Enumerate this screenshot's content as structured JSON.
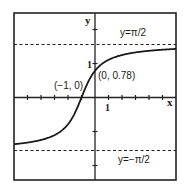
{
  "chart_data": {
    "type": "line",
    "title": "",
    "function": "y = arctan(x + 1)",
    "xlabel": "x",
    "ylabel": "y",
    "xlim": [
      -6,
      6
    ],
    "ylim": [
      -2.4,
      2.5
    ],
    "grid": false,
    "legend": null,
    "x_ticks": [
      -5,
      -4,
      -3,
      -2,
      -1,
      1,
      2,
      3,
      4,
      5
    ],
    "x_tick_labels": [
      {
        "value": 1,
        "label": "1"
      }
    ],
    "y_ticks": [
      -2,
      -1,
      1,
      2
    ],
    "y_tick_labels": [
      {
        "value": 1,
        "label": "1"
      }
    ],
    "series": [
      {
        "name": "arctan(x+1)",
        "x": [
          -6,
          -5,
          -4,
          -3,
          -2,
          -1.5,
          -1,
          -0.5,
          0,
          0.5,
          1,
          2,
          3,
          4,
          5,
          6
        ],
        "values": [
          -1.373,
          -1.326,
          -1.249,
          -1.107,
          -0.785,
          -0.464,
          0,
          0.464,
          0.785,
          0.983,
          1.107,
          1.249,
          1.326,
          1.373,
          1.406,
          1.429
        ]
      }
    ],
    "asymptotes": [
      {
        "y": 1.5708,
        "label": "y=π/2",
        "style": "dashed"
      },
      {
        "y": -1.5708,
        "label": "y=−π/2",
        "style": "dashed"
      }
    ],
    "annotations": [
      {
        "x": -1,
        "y": 0,
        "label": "(−1, 0)"
      },
      {
        "x": 0,
        "y": 0.78,
        "label": "(0, 0.78)"
      }
    ]
  },
  "labels": {
    "x_axis": "x",
    "y_axis": "y",
    "x_tick_one": "1",
    "y_tick_one": "1",
    "upper_asymptote": "y=π/2",
    "lower_asymptote": "y=−π/2",
    "point_root": "(−1, 0)",
    "point_intercept": "(0, 0.78)"
  }
}
